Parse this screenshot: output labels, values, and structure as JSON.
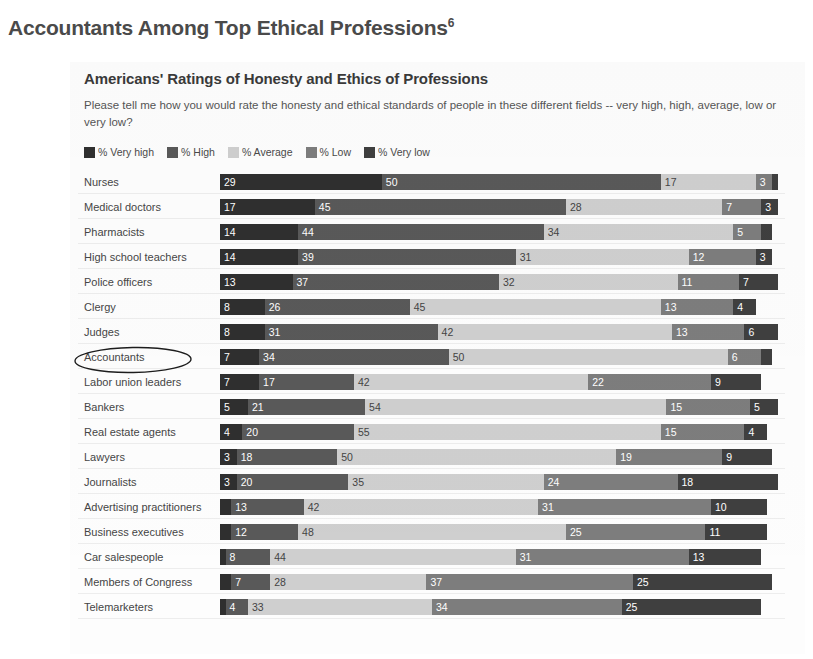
{
  "page": {
    "heading": "Accountants Among Top Ethical Professions",
    "heading_footnote": "6"
  },
  "chart_panel": {
    "title": "Americans' Ratings of Honesty and Ethics of Professions",
    "question": "Please tell me how you would rate the honesty and ethical standards of people in these different fields -- very high, high, average, low or very low?"
  },
  "annotation": {
    "circled_label": "Accountants",
    "shape": "hand-drawn-ellipse"
  },
  "chart_data": {
    "type": "bar",
    "orientation": "horizontal",
    "stacked": true,
    "percent": true,
    "title": "Americans' Ratings of Honesty and Ethics of Professions",
    "subtitle": "Please tell me how you would rate the honesty and ethical standards of people in these different fields -- very high, high, average, low or very low?",
    "xlabel": "",
    "ylabel": "",
    "xlim": [
      0,
      100
    ],
    "grid": false,
    "legend_position": "top-left",
    "legend": [
      "% Very high",
      "% High",
      "% Average",
      "% Low",
      "% Very low"
    ],
    "colors": {
      "very_high": "#2f2f2f",
      "high": "#595959",
      "average": "#cfcfcf",
      "low": "#7d7d7d",
      "very_low": "#3f3f3f"
    },
    "categories": [
      "Nurses",
      "Medical doctors",
      "Pharmacists",
      "High school teachers",
      "Police officers",
      "Clergy",
      "Judges",
      "Accountants",
      "Labor union leaders",
      "Bankers",
      "Real estate agents",
      "Lawyers",
      "Journalists",
      "Advertising practitioners",
      "Business executives",
      "Car salespeople",
      "Members of Congress",
      "Telemarketers"
    ],
    "series": [
      {
        "name": "% Very high",
        "key": "very_high",
        "values": [
          29,
          17,
          14,
          14,
          13,
          8,
          8,
          7,
          7,
          5,
          4,
          3,
          3,
          2,
          2,
          1,
          2,
          1
        ]
      },
      {
        "name": "% High",
        "key": "high",
        "values": [
          50,
          45,
          44,
          39,
          37,
          26,
          31,
          34,
          17,
          21,
          20,
          18,
          20,
          13,
          12,
          8,
          7,
          4
        ]
      },
      {
        "name": "% Average",
        "key": "average",
        "values": [
          17,
          28,
          34,
          31,
          32,
          45,
          42,
          50,
          42,
          54,
          55,
          50,
          35,
          42,
          48,
          44,
          28,
          33
        ]
      },
      {
        "name": "% Low",
        "key": "low",
        "values": [
          3,
          7,
          5,
          12,
          11,
          13,
          13,
          6,
          22,
          15,
          15,
          19,
          24,
          31,
          25,
          31,
          37,
          34
        ]
      },
      {
        "name": "% Very low",
        "key": "very_low",
        "values": [
          1,
          3,
          2,
          3,
          7,
          4,
          6,
          2,
          9,
          5,
          4,
          9,
          18,
          10,
          11,
          13,
          25,
          25
        ]
      }
    ],
    "labeled_values": [
      {
        "category": "Nurses",
        "very_high": "29",
        "high": "50",
        "average": "17",
        "low": "3",
        "very_low": ""
      },
      {
        "category": "Medical doctors",
        "very_high": "17",
        "high": "45",
        "average": "28",
        "low": "7",
        "very_low": "3"
      },
      {
        "category": "Pharmacists",
        "very_high": "14",
        "high": "44",
        "average": "34",
        "low": "5",
        "very_low": ""
      },
      {
        "category": "High school teachers",
        "very_high": "14",
        "high": "39",
        "average": "31",
        "low": "12",
        "very_low": "3"
      },
      {
        "category": "Police officers",
        "very_high": "13",
        "high": "37",
        "average": "32",
        "low": "11",
        "very_low": "7"
      },
      {
        "category": "Clergy",
        "very_high": "8",
        "high": "26",
        "average": "45",
        "low": "13",
        "very_low": "4"
      },
      {
        "category": "Judges",
        "very_high": "8",
        "high": "31",
        "average": "42",
        "low": "13",
        "very_low": "6"
      },
      {
        "category": "Accountants",
        "very_high": "7",
        "high": "34",
        "average": "50",
        "low": "6",
        "very_low": ""
      },
      {
        "category": "Labor union leaders",
        "very_high": "7",
        "high": "17",
        "average": "42",
        "low": "22",
        "very_low": "9"
      },
      {
        "category": "Bankers",
        "very_high": "5",
        "high": "21",
        "average": "54",
        "low": "15",
        "very_low": "5"
      },
      {
        "category": "Real estate agents",
        "very_high": "4",
        "high": "20",
        "average": "55",
        "low": "15",
        "very_low": "4"
      },
      {
        "category": "Lawyers",
        "very_high": "3",
        "high": "18",
        "average": "50",
        "low": "19",
        "very_low": "9"
      },
      {
        "category": "Journalists",
        "very_high": "3",
        "high": "20",
        "average": "35",
        "low": "24",
        "very_low": "18"
      },
      {
        "category": "Advertising practitioners",
        "very_high": "",
        "high": "13",
        "average": "42",
        "low": "31",
        "very_low": "10"
      },
      {
        "category": "Business executives",
        "very_high": "",
        "high": "12",
        "average": "48",
        "low": "25",
        "very_low": "11"
      },
      {
        "category": "Car salespeople",
        "very_high": "",
        "high": "8",
        "average": "44",
        "low": "31",
        "very_low": "13"
      },
      {
        "category": "Members of Congress",
        "very_high": "",
        "high": "7",
        "average": "28",
        "low": "37",
        "very_low": "25"
      },
      {
        "category": "Telemarketers",
        "very_high": "",
        "high": "4",
        "average": "33",
        "low": "34",
        "very_low": "25"
      }
    ]
  }
}
